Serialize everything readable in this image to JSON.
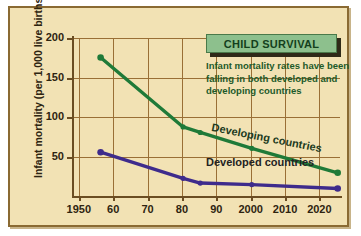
{
  "chart_data": {
    "type": "line",
    "title": "CHILD SURVIVAL",
    "subtitle": "Infant mortality rates have been falling in both developed and developing countries",
    "xlabel": "",
    "ylabel": "Infant mortality (per 1,000 live births)",
    "xlim": [
      1948,
      2026
    ],
    "ylim": [
      0,
      200
    ],
    "xticks": [
      "1950",
      "60",
      "70",
      "80",
      "90",
      "2000",
      "2010",
      "2020"
    ],
    "xtick_values": [
      1950,
      1960,
      1970,
      1980,
      1990,
      2000,
      2010,
      2020
    ],
    "yticks": [
      "50",
      "100",
      "150",
      "200"
    ],
    "ytick_values": [
      50,
      100,
      150,
      200
    ],
    "grid": true,
    "legend_position": "inline-labels",
    "series": [
      {
        "name": "Developing countries",
        "color": "#1f7a38",
        "x": [
          1954,
          1978,
          1983,
          1998,
          2023
        ],
        "values": [
          183,
          95,
          88,
          68,
          37
        ]
      },
      {
        "name": "Developed countries",
        "color": "#3e2b8c",
        "x": [
          1954,
          1978,
          1983,
          1998,
          2023
        ],
        "values": [
          63,
          30,
          24,
          22,
          17
        ]
      }
    ]
  },
  "style": {
    "background": "#f2e2b4",
    "frame_border": "#8a6a33",
    "grid_color": "#9a6f36",
    "axis_color": "#6b4d22",
    "title_fill": "#8dc08d",
    "title_text": "#14401c",
    "subtitle_text": "#1d5a2a"
  }
}
